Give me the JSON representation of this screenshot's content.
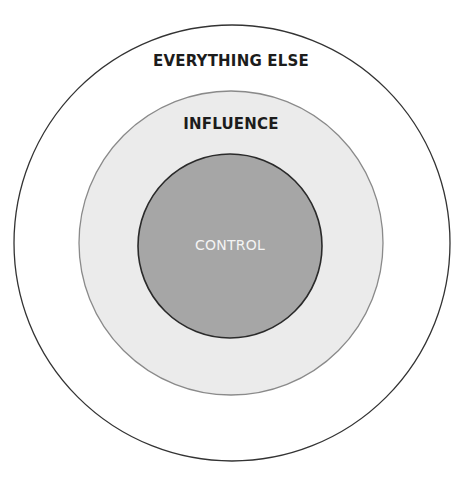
{
  "diagram": {
    "type": "concentric-circles",
    "rings": [
      {
        "id": "outer",
        "label": "EVERYTHING ELSE",
        "fill": "#ffffff",
        "stroke": "#333333"
      },
      {
        "id": "middle",
        "label": "INFLUENCE",
        "fill": "#ebebeb",
        "stroke": "#8a8a8a"
      },
      {
        "id": "inner",
        "label": "CONTROL",
        "fill": "#a6a6a6",
        "stroke": "#2a2a2a"
      }
    ]
  }
}
